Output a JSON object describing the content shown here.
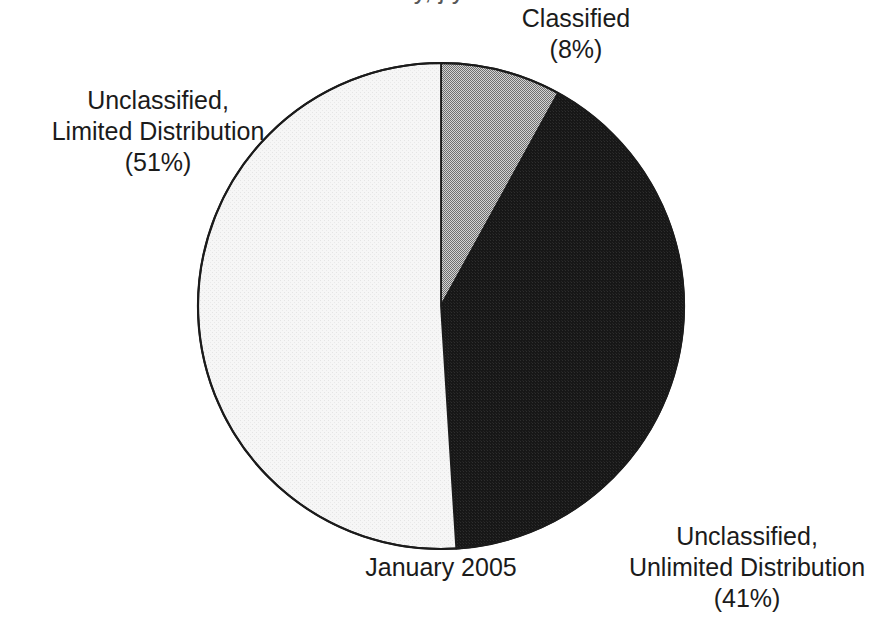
{
  "page": {
    "background_color": "#ffffff",
    "clipped_title_fragment": "y, j                                                    y"
  },
  "chart_data": {
    "type": "pie",
    "title": "",
    "subtitle": "",
    "caption": "January 2005",
    "xlabel": "",
    "ylabel": "",
    "grid": false,
    "legend_position": "none",
    "start_angle_deg": 0,
    "direction": "clockwise",
    "center": {
      "x": 441,
      "y": 306
    },
    "radius": 243,
    "outline_color": "#1b1b1b",
    "categories": [
      "Classified",
      "Unclassified, Unlimited Distribution",
      "Unclassified, Limited Distribution"
    ],
    "values": [
      8,
      41,
      51
    ],
    "value_unit": "%",
    "slices": [
      {
        "name": "Classified",
        "label_line_1": "Classified",
        "label_line_2": "(8%)",
        "value": 8,
        "percent_text": "(8%)",
        "color": "#a8a8a8",
        "start_deg": 0,
        "end_deg": 28.8
      },
      {
        "name": "Unclassified, Unlimited Distribution",
        "label_line_1": "Unclassified,",
        "label_line_2": "Unlimited Distribution",
        "label_line_3": "(41%)",
        "value": 41,
        "percent_text": "(41%)",
        "color": "#1a1a1a",
        "start_deg": 28.8,
        "end_deg": 176.4
      },
      {
        "name": "Unclassified, Limited Distribution",
        "label_line_1": "Unclassified,",
        "label_line_2": "Limited Distribution",
        "label_line_3": "(51%)",
        "value": 51,
        "percent_text": "(51%)",
        "color": "#f2f2f2",
        "start_deg": 176.4,
        "end_deg": 360
      }
    ]
  },
  "labels": {
    "classified": {
      "line1": "Classified",
      "line2": "(8%)"
    },
    "limited": {
      "line1": "Unclassified,",
      "line2": "Limited Distribution",
      "line3": "(51%)"
    },
    "unlimited": {
      "line1": "Unclassified,",
      "line2": "Unlimited Distribution",
      "line3": "(41%)"
    },
    "date": "January 2005"
  }
}
